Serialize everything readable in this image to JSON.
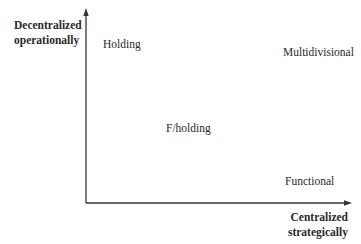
{
  "diagram": {
    "type": "2x2-positioning-map",
    "axes": {
      "y": {
        "label_line1": "Decentralized",
        "label_line2": "operationally"
      },
      "x": {
        "label_line1": "Centralized",
        "label_line2": "strategically"
      }
    },
    "items": [
      {
        "label": "Holding"
      },
      {
        "label": "Multidivisional"
      },
      {
        "label": "F/holding"
      },
      {
        "label": "Functional"
      }
    ],
    "colors": {
      "axis": "#333333",
      "text": "#2a2a2a",
      "background": "#ffffff"
    }
  }
}
